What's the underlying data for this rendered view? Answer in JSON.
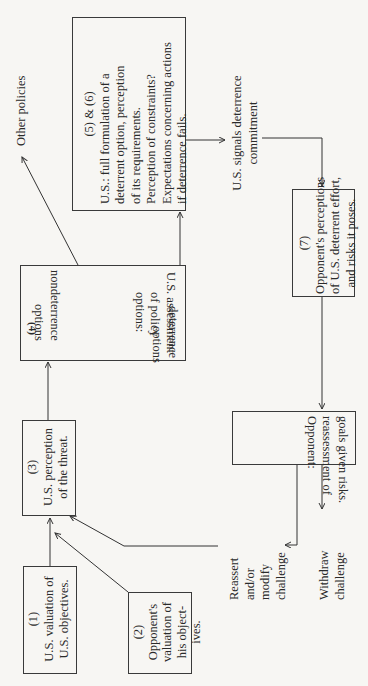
{
  "diagram": {
    "type": "flowchart",
    "orientation": "rotated-90-ccw",
    "nodes": [
      {
        "id": "1",
        "number": "(1)",
        "lines": [
          "U.S. valuation of",
          "U.S. objectives."
        ]
      },
      {
        "id": "2",
        "number": "(2)",
        "lines": [
          "Opponent's",
          "valuation of",
          "his object-",
          "ives."
        ]
      },
      {
        "id": "3",
        "number": "(3)",
        "lines": [
          "U.S. perception",
          "of the threat."
        ]
      },
      {
        "id": "4",
        "number": "(4)",
        "lines": [
          "U.S. assessment",
          "of policy",
          "options:"
        ],
        "options": {
          "left": [
            "deterrence",
            "options"
          ],
          "right": [
            "nondeterrence",
            "options"
          ]
        }
      },
      {
        "id": "5-6",
        "number": "(5) & (6)",
        "lines": [
          "U.S.: full formulation of a",
          "deterrent option, perception",
          "of its requirements.",
          "Perception of constraints?",
          "Expectations concerning actions",
          "if deterrence fails."
        ]
      },
      {
        "id": "7",
        "number": "(7)",
        "lines": [
          "Opponent's perceptions",
          "of U.S. deterrent effort,",
          "and risks it poses."
        ]
      },
      {
        "id": "8",
        "number": "(8)",
        "lines": [
          "Opponent:",
          "reassessment of",
          "goals given risks."
        ]
      }
    ],
    "labels": {
      "other_policies": "Other policies",
      "signals": [
        "U.S. signals deterrence",
        "commitment"
      ],
      "reassert": [
        "Reassert",
        "and/or",
        "modify",
        "challenge"
      ],
      "withdraw": [
        "Withdraw",
        "challenge"
      ]
    },
    "edges": [
      {
        "from": "1",
        "to": "3"
      },
      {
        "from": "2",
        "to": "3"
      },
      {
        "from": "3",
        "to": "4"
      },
      {
        "from": "4",
        "to": "5-6",
        "via": "deterrence options"
      },
      {
        "from": "4",
        "to": "other_policies",
        "via": "nondeterrence options"
      },
      {
        "from": "5-6",
        "to": "7",
        "via": "U.S. signals deterrence commitment"
      },
      {
        "from": "7",
        "to": "8"
      },
      {
        "from": "8",
        "to": "reassert"
      },
      {
        "from": "8",
        "to": "withdraw"
      },
      {
        "from": "reassert",
        "to": "3"
      }
    ],
    "colors": {
      "background": "#f7f6f3",
      "ink": "#2a2a2a"
    }
  }
}
